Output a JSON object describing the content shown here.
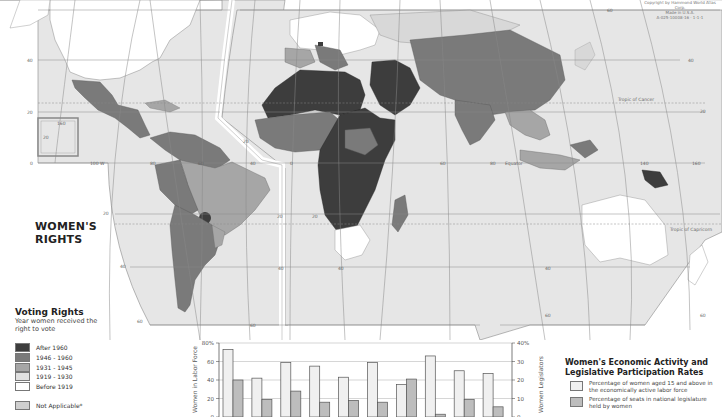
{
  "map": {
    "title_lines": [
      "WOMEN'S",
      "RIGHTS"
    ],
    "imprint_lines": [
      "Copyright by Hammond World Atlas Corp.",
      "Made in U.S.A.",
      "A-025-10008-16 · 1-1-1"
    ],
    "grid_labels": {
      "lat_left": [
        "40",
        "20",
        "0"
      ],
      "lat_right": [
        "60",
        "40",
        "20",
        "0"
      ],
      "lon": [
        "100 W",
        "80",
        "60",
        "40",
        "20",
        "0",
        "60",
        "80",
        "140",
        "160"
      ],
      "south": [
        "20",
        "40",
        "60",
        "20",
        "40",
        "60"
      ],
      "inset": [
        "160",
        "20"
      ],
      "lines": [
        "Tropic of Cancer",
        "Equator",
        "Tropic of Capricorn"
      ]
    },
    "colors": {
      "ocean": "#e6e6e6",
      "after_1960": "#3d3d3d",
      "y1946_1960": "#7a7a7a",
      "y1931_1945": "#a6a6a6",
      "y1919_1930": "#d8d8d8",
      "before_1919": "#ffffff",
      "not_applicable": "#cfcfcf"
    }
  },
  "voting_legend": {
    "heading": "Voting Rights",
    "subtitle": "Year women received the right to vote",
    "items": [
      {
        "label": "After 1960",
        "color": "#3d3d3d"
      },
      {
        "label": "1946 - 1960",
        "color": "#7a7a7a"
      },
      {
        "label": "1931 - 1945",
        "color": "#a6a6a6"
      },
      {
        "label": "1919 - 1930",
        "color": "#e0e0e0"
      },
      {
        "label": "Before 1919",
        "color": "#ffffff"
      }
    ],
    "not_applicable": {
      "label": "Not Applicable*",
      "color": "#cfcfcf"
    }
  },
  "econ_legend": {
    "heading_lines": [
      "Women's Economic Activity and",
      "Legislative Participation Rates"
    ],
    "items": [
      {
        "label": "Percentage of women aged 15 and above in the economically active labor force",
        "color": "#f0f0f0"
      },
      {
        "label": "Percentage of seats in national legislature held by women",
        "color": "#bdbdbd"
      }
    ]
  },
  "chart_data": {
    "type": "bar",
    "title": "Women's Economic Activity and Legislative Participation Rates",
    "categories": [
      "",
      "",
      "",
      "",
      "",
      "",
      "",
      "",
      "",
      ""
    ],
    "series": [
      {
        "name": "Percentage of women aged 15 and above in the economically active labor force",
        "axis": "left",
        "values": [
          73,
          42,
          59,
          55,
          43,
          59,
          35,
          66,
          50,
          47
        ]
      },
      {
        "name": "Percentage of seats in national legislature held by women",
        "axis": "right",
        "values": [
          20,
          9.5,
          14,
          8,
          9,
          8,
          20.5,
          1.5,
          9.5,
          5.5
        ]
      }
    ],
    "ylabel": "Women in Labor Force",
    "ylabel_right": "Women Legislators",
    "yticks_left": [
      "0",
      "20",
      "40",
      "60",
      "80%"
    ],
    "yticks_right": [
      "0",
      "10",
      "20",
      "30",
      "40%"
    ],
    "ylim": [
      0,
      80
    ],
    "ylim_right": [
      0,
      40
    ],
    "grid": true,
    "legend_position": "right"
  }
}
